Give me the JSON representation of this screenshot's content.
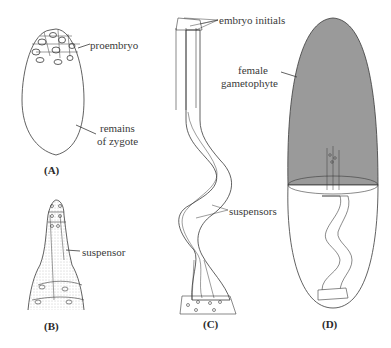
{
  "figure": {
    "panels": [
      {
        "id": "A",
        "caption": "(A)",
        "labels": [
          "proembryo",
          "remains of zygote"
        ]
      },
      {
        "id": "B",
        "caption": "(B)",
        "labels": [
          "suspensor"
        ]
      },
      {
        "id": "C",
        "caption": "(C)",
        "labels": [
          "embryo initials",
          "suspensors"
        ]
      },
      {
        "id": "D",
        "caption": "(D)",
        "labels": [
          "female gametophyte"
        ]
      }
    ],
    "labels": {
      "proembryo": "proembryo",
      "remains_line1": "remains",
      "remains_line2": "of zygote",
      "suspensor": "suspensor",
      "embryo_initials": "embryo initials",
      "suspensors": "suspensors",
      "female_line1": "female",
      "female_line2": "gametophyte"
    },
    "captions": {
      "a": "(A)",
      "b": "(B)",
      "c": "(C)",
      "d": "(D)"
    },
    "colors": {
      "line": "#3a3a3a",
      "gametophyte_fill": "#9a9a9a",
      "background": "#ffffff"
    }
  }
}
